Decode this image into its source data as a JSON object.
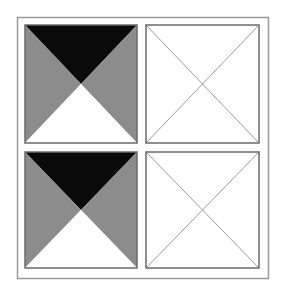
{
  "diagram": {
    "title": "",
    "colors": {
      "background": "#ffffff",
      "outer_border": "#9a9a9a",
      "black": "#0a0a0a",
      "gray": "#8c8c8c",
      "white": "#ffffff",
      "cell_stroke": "#6a6a6a",
      "diagonal_stroke": "#9a9a9a"
    },
    "outer_frame": {
      "x": 17,
      "y": 17,
      "width": 251,
      "height": 261
    },
    "cells": [
      {
        "name": "top-left",
        "x": 25,
        "y": 25,
        "width": 112,
        "height": 118,
        "style": "filled"
      },
      {
        "name": "top-right",
        "x": 146,
        "y": 25,
        "width": 113,
        "height": 118,
        "style": "outline"
      },
      {
        "name": "bottom-left",
        "x": 25,
        "y": 152,
        "width": 112,
        "height": 116,
        "style": "filled"
      },
      {
        "name": "bottom-right",
        "x": 146,
        "y": 152,
        "width": 113,
        "height": 116,
        "style": "outline"
      }
    ]
  }
}
